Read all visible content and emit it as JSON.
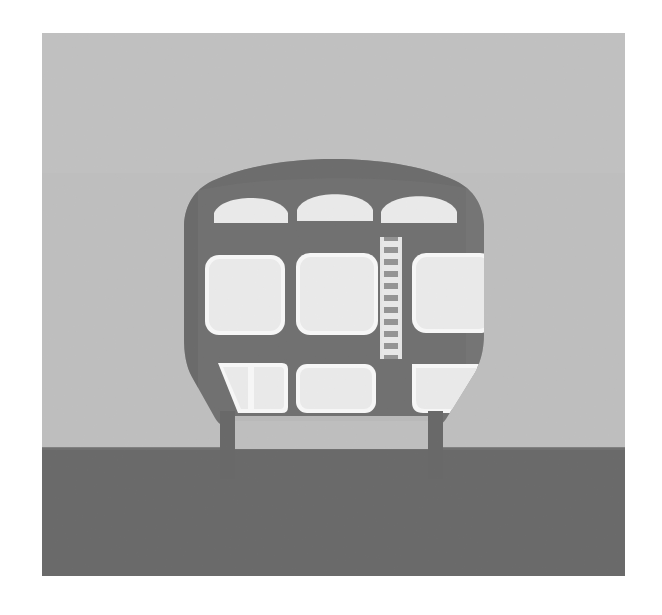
{
  "scene": {
    "title": "Front view of a commuter train car",
    "subject": "train-front",
    "medium": "flat grayscale illustration",
    "canvas": {
      "width": 662,
      "height": 615
    },
    "artboard": {
      "x": 42,
      "y": 33,
      "width": 583,
      "height": 543
    }
  },
  "colors": {
    "page_background": "#ffffff",
    "sky": "#c5c5c5",
    "sky_shadow": "#bdbdbd",
    "ground": "#6e6e6e",
    "body": "#757575",
    "body_shadow": "#6a6a6a",
    "body_highlight": "#808080",
    "window_glass": "#f2f2f2",
    "window_frame": "#ffffff",
    "ladder_rail": "#ededed",
    "ladder_rung": "#9a9a9a",
    "leg": "#6d6d6d",
    "outline": "#5f5f5f"
  },
  "background": {
    "sky": {
      "label": "sky",
      "top": 0,
      "height": 415,
      "fill": "#c5c5c5"
    },
    "ground": {
      "label": "ground",
      "top": 415,
      "height": 128,
      "fill": "#6e6e6e"
    },
    "horizon_y": 415
  },
  "train": {
    "label": "train car front",
    "body": {
      "label": "car body shell",
      "fill": "#757575",
      "left": 142,
      "right": 442,
      "top": 148,
      "bottom": 415
    },
    "upper_windows": {
      "label": "upper arched clerestory windows",
      "count": 3,
      "shape": "arch",
      "fill": "#f2f2f2",
      "items": [
        {
          "name": "upper-window-left",
          "x": 171,
          "y": 176,
          "width": 74,
          "height": 32
        },
        {
          "name": "upper-window-center",
          "x": 254,
          "y": 172,
          "width": 76,
          "height": 33
        },
        {
          "name": "upper-window-right",
          "x": 338,
          "y": 174,
          "width": 76,
          "height": 33
        }
      ]
    },
    "middle_windows": {
      "label": "main passenger windows",
      "count": 3,
      "shape": "rounded-rectangle",
      "fill": "#f2f2f2",
      "items": [
        {
          "name": "main-window-left",
          "x": 164,
          "y": 224,
          "width": 76,
          "height": 76
        },
        {
          "name": "main-window-center",
          "x": 256,
          "y": 222,
          "width": 78,
          "height": 78
        },
        {
          "name": "main-window-right",
          "x": 372,
          "y": 222,
          "width": 72,
          "height": 74
        }
      ]
    },
    "lower_windows": {
      "label": "lower cab windows",
      "count": 3,
      "fill": "#f2f2f2",
      "items": [
        {
          "name": "lower-window-left",
          "x": 168,
          "y": 330,
          "width": 74,
          "height": 50,
          "shape": "angled-trapezoid",
          "panes": 2
        },
        {
          "name": "lower-window-center",
          "x": 256,
          "y": 332,
          "width": 74,
          "height": 46,
          "shape": "rounded-rectangle",
          "panes": 1
        },
        {
          "name": "lower-window-right",
          "x": 368,
          "y": 330,
          "width": 72,
          "height": 48,
          "shape": "clipped-trapezoid",
          "panes": 1
        }
      ]
    },
    "ladder": {
      "label": "vertical access ladder",
      "x": 339,
      "y": 205,
      "width": 20,
      "height": 118,
      "rung_count": 10,
      "rail_fill": "#ededed",
      "rung_fill": "#9a9a9a"
    },
    "legs": {
      "label": "support legs / bogie posts",
      "count": 2,
      "fill": "#6d6d6d",
      "items": [
        {
          "name": "leg-left",
          "x": 178,
          "y": 383,
          "width": 14,
          "height": 62
        },
        {
          "name": "leg-right",
          "x": 386,
          "y": 383,
          "width": 14,
          "height": 62
        }
      ]
    },
    "skirt": {
      "label": "under-body skirt gap",
      "x": 192,
      "y": 383,
      "width": 194,
      "height": 32
    }
  },
  "annotations": {
    "alt_text": "Grayscale illustration of the front of a train car with three arched roof windows, three large square windows, a vertical ladder on the right side, three lower windows and two legs resting on darker ground."
  }
}
